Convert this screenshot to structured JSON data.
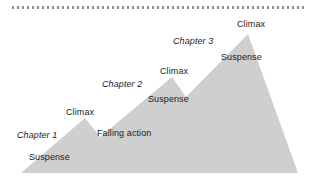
{
  "figure": {
    "background_color": "#ffffff",
    "mountain_fill": "#cfcfcf",
    "text_color": "#1c1c1c",
    "rule_color": "#8d8d8d"
  },
  "rule": {
    "style": "dotted",
    "label": "dotted-divider"
  },
  "labels": {
    "chapter_1": "Chapter 1",
    "suspense_1": "Suspense",
    "climax_1": "Climax",
    "falling_action": "Falling action",
    "chapter_2": "Chapter 2",
    "suspense_2": "Suspense",
    "climax_2": "Climax",
    "chapter_3": "Chapter 3",
    "suspense_3": "Suspense",
    "climax_3": "Climax"
  },
  "chart_data": {
    "type": "area",
    "xlabel": "",
    "ylabel": "Tension",
    "grid": false,
    "legend": "none",
    "xlim": [
      0,
      313
    ],
    "ylim": [
      190,
      0
    ],
    "series": [
      {
        "name": "Tension arc",
        "points": [
          [
            21,
            173
          ],
          [
            85,
            118
          ],
          [
            100,
            137
          ],
          [
            172,
            77
          ],
          [
            186,
            97
          ],
          [
            248,
            34
          ],
          [
            298,
            173
          ]
        ]
      }
    ],
    "annotations": [
      {
        "text": "Chapter 1",
        "x": 17,
        "y": 130,
        "style": "italic"
      },
      {
        "text": "Suspense",
        "x": 29,
        "y": 152,
        "style": "normal"
      },
      {
        "text": "Climax",
        "x": 66,
        "y": 107,
        "style": "normal"
      },
      {
        "text": "Falling action",
        "x": 97,
        "y": 128,
        "style": "normal"
      },
      {
        "text": "Chapter 2",
        "x": 102,
        "y": 79,
        "style": "italic"
      },
      {
        "text": "Suspense",
        "x": 148,
        "y": 94,
        "style": "normal"
      },
      {
        "text": "Climax",
        "x": 160,
        "y": 66,
        "style": "normal"
      },
      {
        "text": "Chapter 3",
        "x": 173,
        "y": 36,
        "style": "italic"
      },
      {
        "text": "Suspense",
        "x": 221,
        "y": 52,
        "style": "normal"
      },
      {
        "text": "Climax",
        "x": 237,
        "y": 19,
        "style": "normal"
      }
    ]
  }
}
